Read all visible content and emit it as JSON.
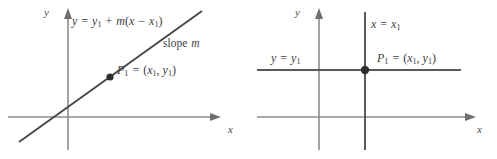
{
  "figure": {
    "type": "math-diagram",
    "stroke_colors": {
      "axis": "#8c8c8c",
      "plotted_line": "#4a4a4a",
      "point_marker": "#2f2f2f",
      "text": "#3d3d3d",
      "background": "#ffffff"
    }
  },
  "panels": [
    {
      "id": "point-slope-line",
      "axes": {
        "x_label": "x",
        "y_label": "y"
      },
      "labels": {
        "equation_y": "y",
        "equation_eq": "=",
        "equation_y1": "y",
        "equation_y1_sub": "1",
        "equation_plus": "+",
        "equation_m": "m",
        "equation_open": "(",
        "equation_x": "x",
        "equation_minus": "−",
        "equation_x1": "x",
        "equation_x1_sub": "1",
        "equation_close": ")",
        "equation_full": "y = y1 + m(x − x1)",
        "slope_word": "slope",
        "slope_symbol": "m",
        "point_name": "P",
        "point_sub": "1",
        "point_eq": "=",
        "point_coords_open": "(",
        "point_coord_x": "x",
        "point_coord_x_sub": "1",
        "point_comma": ",",
        "point_coord_y": "y",
        "point_coord_y_sub": "1",
        "point_coords_close": ")",
        "point_full": "P1 = (x1, y1)"
      }
    },
    {
      "id": "vertical-horizontal-lines",
      "axes": {
        "x_label": "x",
        "y_label": "y"
      },
      "labels": {
        "vline_x": "x",
        "vline_eq": "=",
        "vline_x1": "x",
        "vline_x1_sub": "1",
        "vline_full": "x = x1",
        "hline_y": "y",
        "hline_eq": "=",
        "hline_y1": "y",
        "hline_y1_sub": "1",
        "hline_full": "y = y1",
        "point_name": "P",
        "point_sub": "1",
        "point_eq": "=",
        "point_coords_open": "(",
        "point_coord_x": "x",
        "point_coord_x_sub": "1",
        "point_comma": ",",
        "point_coord_y": "y",
        "point_coord_y_sub": "1",
        "point_coords_close": ")",
        "point_full": "P1 = (x1, y1)"
      }
    }
  ]
}
